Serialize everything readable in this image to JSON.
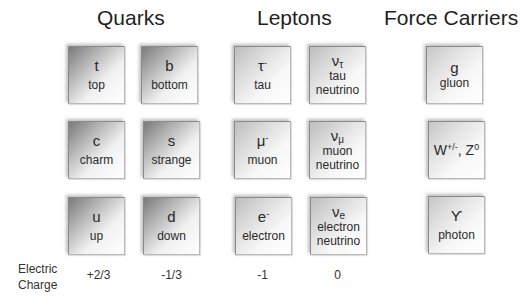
{
  "headings": {
    "quarks": "Quarks",
    "leptons": "Leptons",
    "force_carriers": "Force Carriers"
  },
  "quarks": [
    {
      "symbol": "t",
      "name": "top"
    },
    {
      "symbol": "b",
      "name": "bottom"
    },
    {
      "symbol": "c",
      "name": "charm"
    },
    {
      "symbol": "s",
      "name": "strange"
    },
    {
      "symbol": "u",
      "name": "up"
    },
    {
      "symbol": "d",
      "name": "down"
    }
  ],
  "leptons": [
    {
      "symbol": "τ",
      "sup": "-",
      "name": "tau"
    },
    {
      "symbol": "ν",
      "sub": "τ",
      "name_line1": "tau",
      "name_line2": "neutrino"
    },
    {
      "symbol": "μ",
      "sup": "-",
      "name": "muon"
    },
    {
      "symbol": "ν",
      "sub": "μ",
      "name_line1": "muon",
      "name_line2": "neutrino"
    },
    {
      "symbol": "e",
      "sup": "-",
      "name": "electron"
    },
    {
      "symbol": "ν",
      "sub": "e",
      "name_line1": "electron",
      "name_line2": "neutrino"
    }
  ],
  "force_carriers": [
    {
      "symbol": "g",
      "name": "gluon"
    },
    {
      "w": "W",
      "w_sup": "+/-",
      "sep": ", ",
      "z": "Z",
      "z_sup": "0"
    },
    {
      "symbol": "ϒ",
      "name": "photon"
    }
  ],
  "charge_row": {
    "label_line1": "Electric",
    "label_line2": "Charge",
    "values": [
      "+2/3",
      "-1/3",
      "-1",
      "0"
    ]
  }
}
